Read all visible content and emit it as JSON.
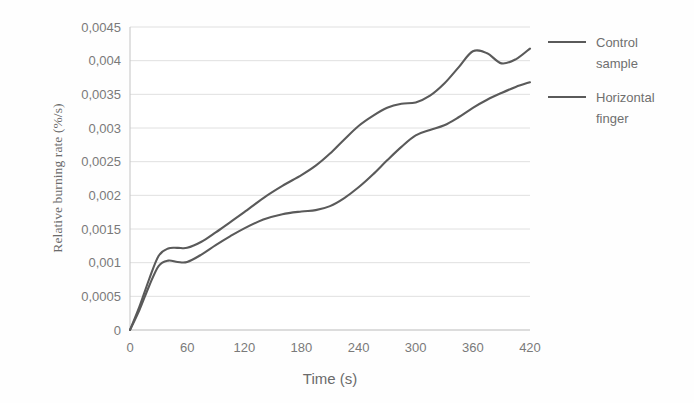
{
  "chart_data": {
    "type": "line",
    "title": "",
    "xlabel": "Time (s)",
    "ylabel": "Relative burning rate (%/s)",
    "xlim": [
      0,
      420
    ],
    "ylim": [
      0,
      0.0045
    ],
    "grid": "horizontal",
    "legend_position": "right",
    "x_ticks": [
      "0",
      "60",
      "120",
      "180",
      "240",
      "300",
      "360",
      "420"
    ],
    "x_tick_values": [
      0,
      60,
      120,
      180,
      240,
      300,
      360,
      420
    ],
    "y_ticks": [
      "0",
      "0,0005",
      "0,001",
      "0,0015",
      "0,002",
      "0,0025",
      "0,003",
      "0,0035",
      "0,004",
      "0,0045"
    ],
    "y_tick_values": [
      0,
      0.0005,
      0.001,
      0.0015,
      0.002,
      0.0025,
      0.003,
      0.0035,
      0.004,
      0.0045
    ],
    "decimal_separator": ",",
    "line_color": "#5a5a5a",
    "grid_color": "#dcdcdc",
    "background_color": "#fefefe",
    "x": [
      0,
      10,
      20,
      30,
      40,
      50,
      60,
      75,
      90,
      105,
      120,
      140,
      160,
      180,
      195,
      210,
      225,
      240,
      255,
      270,
      285,
      300,
      315,
      330,
      345,
      360,
      375,
      390,
      405,
      420
    ],
    "series": [
      {
        "name": "Control sample",
        "values": [
          0,
          0.00035,
          0.00075,
          0.0011,
          0.00121,
          0.00122,
          0.00122,
          0.00131,
          0.00145,
          0.0016,
          0.00175,
          0.00196,
          0.00214,
          0.0023,
          0.00244,
          0.00262,
          0.00283,
          0.00303,
          0.00318,
          0.0033,
          0.00336,
          0.00338,
          0.00348,
          0.00366,
          0.0039,
          0.00414,
          0.00411,
          0.00396,
          0.00402,
          0.00418
        ]
      },
      {
        "name": "Horizontal finger",
        "values": [
          0,
          0.0003,
          0.00065,
          0.00095,
          0.00103,
          0.00101,
          0.00101,
          0.00112,
          0.00126,
          0.00139,
          0.00151,
          0.00164,
          0.00172,
          0.00176,
          0.00178,
          0.00184,
          0.00196,
          0.00212,
          0.00231,
          0.00252,
          0.00272,
          0.00289,
          0.00297,
          0.00304,
          0.00316,
          0.0033,
          0.00342,
          0.00352,
          0.00361,
          0.00368
        ]
      }
    ]
  },
  "legend": {
    "entries": [
      {
        "label_line1": "Control",
        "label_line2": "sample",
        "color": "#5a5a5a"
      },
      {
        "label_line1": "Horizontal",
        "label_line2": "finger",
        "color": "#5a5a5a"
      }
    ]
  },
  "axes": {
    "y_title": "Relative burning rate (%/s)",
    "x_title": "Time (s)"
  }
}
